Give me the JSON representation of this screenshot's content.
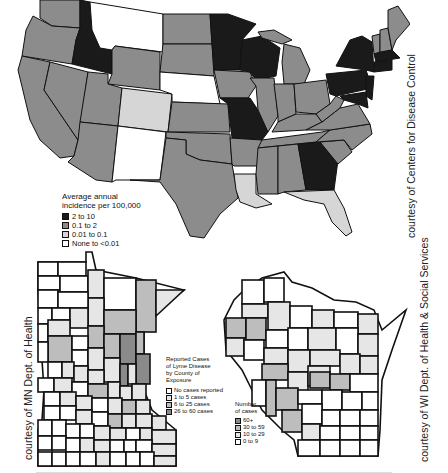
{
  "us_map": {
    "legend": {
      "title_line1": "Average annual",
      "title_line2": "incidence per 100,000",
      "items": [
        {
          "label": "2 to 10",
          "color": "#1a1a1a"
        },
        {
          "label": "0.1 to 2",
          "color": "#8c8c8c"
        },
        {
          "label": "0.01 to 0.1",
          "color": "#d6d6d6"
        },
        {
          "label": "None to <0.01",
          "color": "#ffffff"
        }
      ]
    },
    "credit": "courtesy of Centers for Disease Control",
    "categories": {
      "2 to 10": [
        "ID",
        "MN",
        "WI",
        "MO",
        "GA",
        "NY",
        "PA",
        "NJ",
        "CT",
        "RI",
        "MA",
        "MD",
        "DE"
      ],
      "0.1 to 2": [
        "WA",
        "OR",
        "CA",
        "NV",
        "UT",
        "AZ",
        "WY",
        "ND",
        "SD",
        "KS",
        "OK",
        "TX",
        "IA",
        "IL",
        "IN",
        "OH",
        "MI",
        "KY",
        "TN",
        "AR",
        "MS",
        "AL",
        "SC",
        "NC",
        "VA",
        "WV",
        "VT",
        "NH",
        "ME"
      ],
      "0.01 to 0.1": [
        "CO",
        "LA",
        "FL"
      ],
      "None to <0.01": [
        "MT",
        "NE",
        "NM"
      ]
    }
  },
  "mn_map": {
    "credit": "courtesy of MN Dept. of Health",
    "legend": {
      "title_lines": [
        "Reported Cases",
        "of Lyme Disease",
        "by County of",
        "Exposure"
      ],
      "items": [
        {
          "label": "No cases reported",
          "color": "#ffffff"
        },
        {
          "label": "1 to 5 cases",
          "color": "#e6e6e6"
        },
        {
          "label": "6 to 25 cases",
          "color": "#bdbdbd"
        },
        {
          "label": "26 to 60 cases",
          "color": "#8a8a8a"
        }
      ]
    }
  },
  "wi_map": {
    "credit": "courtesy of WI Dept. of Health & Social Services",
    "legend": {
      "title_lines": [
        "Number",
        "of cases"
      ],
      "items": [
        {
          "label": "60+",
          "color": "#8a8a8a"
        },
        {
          "label": "30 to 59",
          "color": "#bdbdbd"
        },
        {
          "label": "10 to 29",
          "color": "#e6e6e6"
        },
        {
          "label": "0 to 9",
          "color": "#ffffff"
        }
      ]
    }
  }
}
